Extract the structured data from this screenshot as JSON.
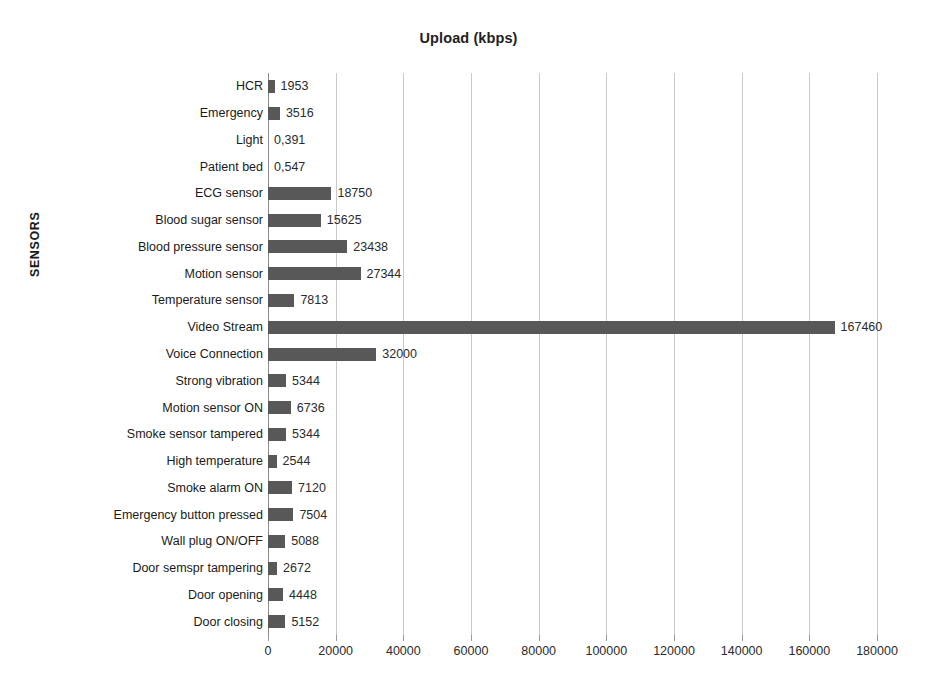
{
  "chart_data": {
    "type": "bar",
    "orientation": "horizontal",
    "title": "Upload (kbps)",
    "xlabel": "",
    "ylabel": "SENSORS",
    "xlim": [
      0,
      180000
    ],
    "grid": true,
    "legend": "none",
    "xticks": [
      0,
      20000,
      40000,
      60000,
      80000,
      100000,
      120000,
      140000,
      160000,
      180000
    ],
    "xtick_labels": [
      "0",
      "20000",
      "40000",
      "60000",
      "80000",
      "100000",
      "120000",
      "140000",
      "160000",
      "180000"
    ],
    "categories": [
      "HCR",
      "Emergency",
      "Light",
      "Patient bed",
      "ECG sensor",
      "Blood sugar sensor",
      "Blood pressure sensor",
      "Motion sensor",
      "Temperature sensor",
      "Video Stream",
      "Voice Connection",
      "Strong vibration",
      "Motion sensor ON",
      "Smoke sensor tampered",
      "High temperature",
      "Smoke alarm ON",
      "Emergency button pressed",
      "Wall plug ON/OFF",
      "Door semspr tampering",
      "Door opening",
      "Door closing"
    ],
    "values": [
      1953,
      3516,
      0.391,
      0.547,
      18750,
      15625,
      23438,
      27344,
      7813,
      167460,
      32000,
      5344,
      6736,
      5344,
      2544,
      7120,
      7504,
      5088,
      2672,
      4448,
      5152
    ],
    "data_labels": [
      "1953",
      "3516",
      "0,391",
      "0,547",
      "18750",
      "15625",
      "23438",
      "27344",
      "7813",
      "167460",
      "32000",
      "5344",
      "6736",
      "5344",
      "2544",
      "7120",
      "7504",
      "5088",
      "2672",
      "4448",
      "5152"
    ],
    "series": [
      {
        "name": "Upload (kbps)",
        "color": "#585858",
        "values": [
          1953,
          3516,
          0.391,
          0.547,
          18750,
          15625,
          23438,
          27344,
          7813,
          167460,
          32000,
          5344,
          6736,
          5344,
          2544,
          7120,
          7504,
          5088,
          2672,
          4448,
          5152
        ]
      }
    ]
  },
  "style": {
    "bar_color": "#585858",
    "gridline_color": "#c9c9c9",
    "axis_color": "#8a8a8a",
    "text_color": "#1a1a1a",
    "background": "#ffffff"
  }
}
